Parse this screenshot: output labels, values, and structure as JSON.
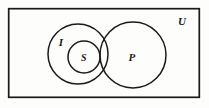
{
  "diagram": {
    "type": "venn-diagram",
    "title": "",
    "universe": {
      "label": "U",
      "shape": "rectangle",
      "x": 8,
      "y": 8,
      "width": 192,
      "height": 90
    },
    "sets": [
      {
        "id": "I",
        "label": "I",
        "shape": "circle",
        "cx": 78,
        "cy": 54,
        "r": 30
      },
      {
        "id": "S",
        "label": "S",
        "shape": "circle",
        "cx": 84,
        "cy": 57,
        "r": 16
      },
      {
        "id": "P",
        "label": "P",
        "shape": "circle",
        "cx": 133,
        "cy": 55,
        "r": 33
      }
    ],
    "relations": [
      "S is a subset of I",
      "I and P overlap",
      "S and P overlap"
    ],
    "colors": {
      "stroke": "#1a1a1a",
      "fill": "none",
      "background": "#fdfdfc",
      "label": "#1a1a1a"
    },
    "stroke_width": 1.4
  }
}
